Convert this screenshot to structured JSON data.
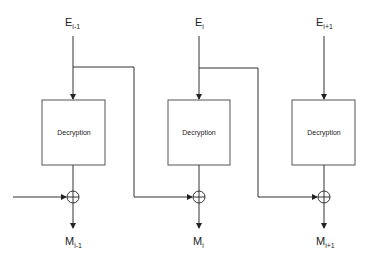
{
  "diagram": {
    "blocks": [
      {
        "input_base": "E",
        "input_sub": "i-1",
        "box_label": "Decryption",
        "output_base": "M",
        "output_sub": "i-1"
      },
      {
        "input_base": "E",
        "input_sub": "i",
        "box_label": "Decryption",
        "output_base": "M",
        "output_sub": "i"
      },
      {
        "input_base": "E",
        "input_sub": "i+1",
        "box_label": "Decryption",
        "output_base": "M",
        "output_sub": "i+1"
      }
    ],
    "xor_symbol": "⊕",
    "colors": {
      "line": "#333333",
      "box_border": "#555555",
      "background": "#ffffff"
    }
  }
}
